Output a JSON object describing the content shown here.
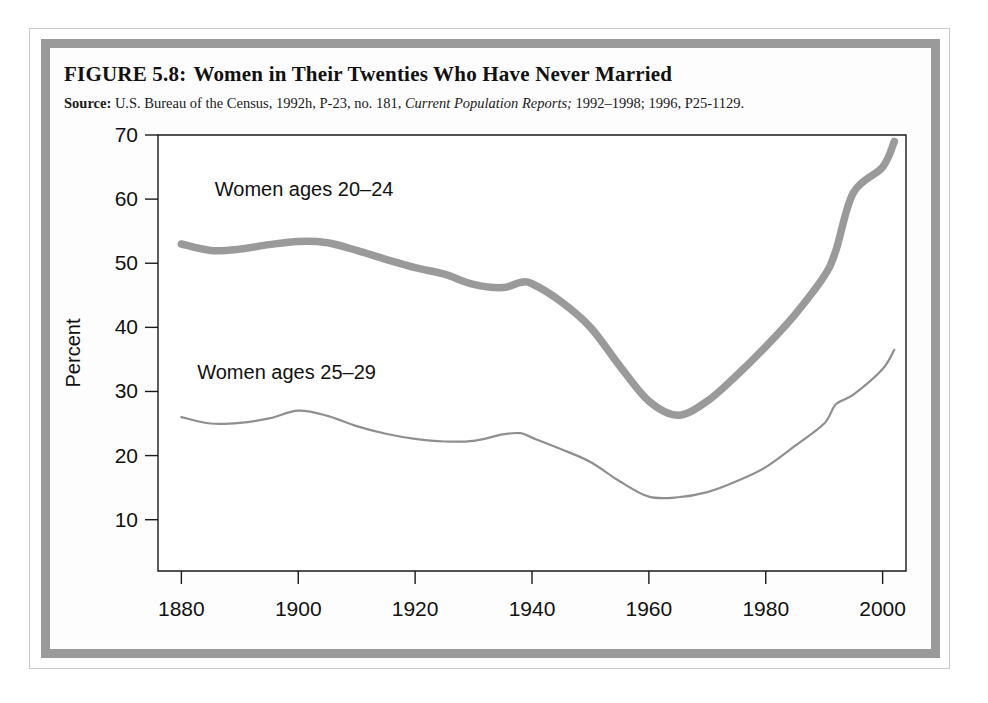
{
  "figure": {
    "number_label": "FIGURE 5.8:",
    "title": "Women in Their Twenties Who Have Never Married",
    "source_prefix": "Source:",
    "source_part1": "U.S. Bureau of the Census, 1992h, P-23, no. 181,",
    "source_italic": "Current Population Reports;",
    "source_part2": "1992–1998; 1996, P25-1129."
  },
  "chart_data": {
    "type": "line",
    "title": "Women in Their Twenties Who Have Never Married",
    "xlabel": "",
    "ylabel": "Percent",
    "xlim": [
      1876,
      2004
    ],
    "ylim": [
      2,
      70
    ],
    "grid": false,
    "legend_position": "inline-annotation",
    "xticks": [
      1880,
      1900,
      1920,
      1940,
      1960,
      1980,
      2000
    ],
    "xtick_labels": [
      "1880",
      "1900",
      "1920",
      "1940",
      "1960",
      "1980",
      "2000"
    ],
    "yticks": [
      10,
      20,
      30,
      40,
      50,
      60,
      70
    ],
    "ytick_labels": [
      "10",
      "20",
      "30",
      "40",
      "50",
      "60",
      "70"
    ],
    "series": [
      {
        "name": "Women ages 20–24",
        "style": "thick",
        "color": "#9a9a9a",
        "label_x": 1901,
        "label_y": 60.5,
        "x": [
          1880,
          1885,
          1890,
          1895,
          1900,
          1905,
          1910,
          1915,
          1920,
          1925,
          1930,
          1935,
          1938,
          1940,
          1945,
          1950,
          1955,
          1960,
          1965,
          1970,
          1975,
          1980,
          1985,
          1990,
          1992,
          1995,
          2000,
          2002
        ],
        "y": [
          53.0,
          52.0,
          52.2,
          52.9,
          53.4,
          53.2,
          52.0,
          50.6,
          49.3,
          48.3,
          46.7,
          46.2,
          47.0,
          46.8,
          44.0,
          40.0,
          34.0,
          28.5,
          26.3,
          28.5,
          32.5,
          37.0,
          42.0,
          48.0,
          52.0,
          61.0,
          65.0,
          69.0
        ]
      },
      {
        "name": "Women ages 25–29",
        "style": "thin",
        "color": "#8f8f8f",
        "label_x": 1898,
        "label_y": 32.0,
        "x": [
          1880,
          1885,
          1890,
          1895,
          1900,
          1905,
          1910,
          1915,
          1920,
          1925,
          1930,
          1935,
          1938,
          1940,
          1945,
          1950,
          1955,
          1960,
          1965,
          1970,
          1975,
          1980,
          1985,
          1990,
          1992,
          1995,
          2000,
          2002
        ],
        "y": [
          26.0,
          25.0,
          25.1,
          25.8,
          27.0,
          26.2,
          24.6,
          23.4,
          22.6,
          22.2,
          22.3,
          23.3,
          23.5,
          22.8,
          21.0,
          19.0,
          16.0,
          13.6,
          13.5,
          14.3,
          16.0,
          18.2,
          21.5,
          25.0,
          28.0,
          29.5,
          33.5,
          36.5
        ]
      }
    ]
  }
}
